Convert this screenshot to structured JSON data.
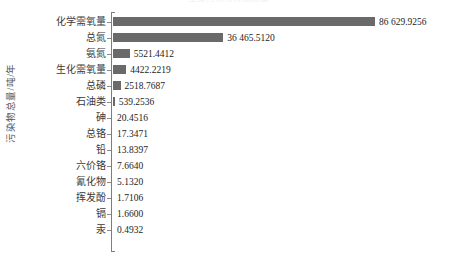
{
  "chart_data": {
    "type": "bar",
    "orientation": "horizontal",
    "title": "主要污染物排放总量",
    "xlabel": "",
    "ylabel": "污染物总量/吨/年",
    "grid": false,
    "legend": null,
    "xlim": [
      0,
      86629.9256
    ],
    "categories": [
      "化学需氧量",
      "总氮",
      "氨氮",
      "生化需氧量",
      "总磷",
      "石油类",
      "砷",
      "总铬",
      "铅",
      "六价铬",
      "氰化物",
      "挥发酚",
      "镉",
      "汞"
    ],
    "values": [
      86629.9256,
      36465.512,
      5521.4412,
      4422.2219,
      2518.7687,
      539.2536,
      20.4516,
      17.3471,
      13.8397,
      7.664,
      5.132,
      1.7106,
      1.66,
      0.4932
    ],
    "value_labels": [
      "86 629.9256",
      "36 465.5120",
      "5521.4412",
      "4422.2219",
      "2518.7687",
      "539.2536",
      "20.4516",
      "17.3471",
      "13.8397",
      "7.6640",
      "5.1320",
      "1.7106",
      "1.6600",
      "0.4932"
    ],
    "bar_color": "#6a6a6a",
    "axis_color": "#7d7d7d",
    "background_color": "#ffffff"
  }
}
